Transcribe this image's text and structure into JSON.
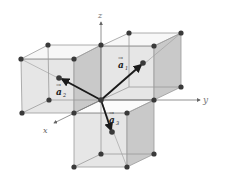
{
  "diagram": {
    "title": "",
    "axes": {
      "x_label": "x",
      "y_label": "y",
      "z_label": "z"
    },
    "vectors": [
      {
        "id": "a1",
        "label": "a",
        "subscript": "1",
        "accent": "→"
      },
      {
        "id": "a2",
        "label": "a",
        "subscript": "2",
        "accent": "→"
      },
      {
        "id": "a3",
        "label": "a",
        "subscript": "3",
        "accent": "→"
      }
    ],
    "colors": {
      "face_light": "#e4e4e4",
      "face_dark": "#c8c8c8",
      "edge": "#9a9a9a",
      "atom": "#3a3a3a",
      "vector": "#1a1a1a",
      "axis": "#888888"
    }
  }
}
